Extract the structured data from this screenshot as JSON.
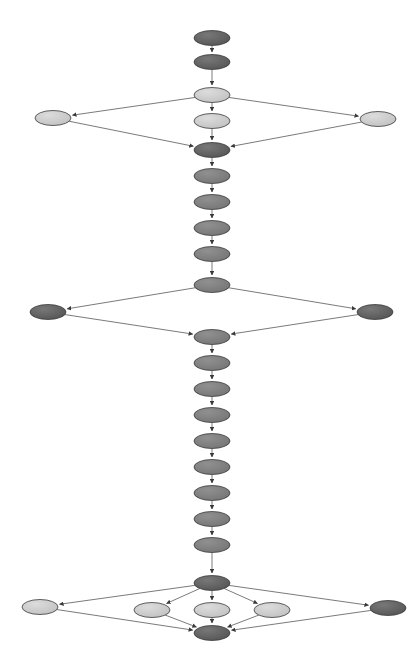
{
  "diagram": {
    "type": "node-link-graph",
    "canvas": {
      "width": 420,
      "height": 671,
      "background": "#ffffff"
    },
    "node_shape": "ellipse",
    "node_size": {
      "rx": 18,
      "ry": 7.5
    },
    "palette": {
      "dark": "#5e5e5e",
      "medium": "#7d7d7d",
      "light": "#c9c9c9",
      "node_stroke": "#3a3a3a",
      "edge": "#6b6b6b",
      "arrowhead": "#3a3a3a"
    },
    "nodes": [
      {
        "id": "n1",
        "x": 212,
        "y": 38,
        "fill": "dark",
        "label": ""
      },
      {
        "id": "n2",
        "x": 212,
        "y": 62,
        "fill": "dark",
        "label": ""
      },
      {
        "id": "n3",
        "x": 212,
        "y": 95,
        "fill": "light",
        "label": ""
      },
      {
        "id": "n4",
        "x": 212,
        "y": 121,
        "fill": "light",
        "label": ""
      },
      {
        "id": "n5",
        "x": 53,
        "y": 118,
        "fill": "light",
        "label": ""
      },
      {
        "id": "n6",
        "x": 378,
        "y": 119,
        "fill": "light",
        "label": ""
      },
      {
        "id": "n7",
        "x": 212,
        "y": 150,
        "fill": "dark",
        "label": ""
      },
      {
        "id": "n8",
        "x": 212,
        "y": 176,
        "fill": "medium",
        "label": ""
      },
      {
        "id": "n9",
        "x": 212,
        "y": 202,
        "fill": "medium",
        "label": ""
      },
      {
        "id": "n10",
        "x": 212,
        "y": 228,
        "fill": "medium",
        "label": ""
      },
      {
        "id": "n11",
        "x": 212,
        "y": 254,
        "fill": "medium",
        "label": ""
      },
      {
        "id": "n12",
        "x": 212,
        "y": 285,
        "fill": "medium",
        "label": ""
      },
      {
        "id": "n13",
        "x": 48,
        "y": 312,
        "fill": "dark",
        "label": ""
      },
      {
        "id": "n14",
        "x": 375,
        "y": 312,
        "fill": "dark",
        "label": ""
      },
      {
        "id": "n15",
        "x": 212,
        "y": 337,
        "fill": "medium",
        "label": ""
      },
      {
        "id": "n16",
        "x": 212,
        "y": 363,
        "fill": "medium",
        "label": ""
      },
      {
        "id": "n17",
        "x": 212,
        "y": 389,
        "fill": "medium",
        "label": ""
      },
      {
        "id": "n18",
        "x": 212,
        "y": 415,
        "fill": "medium",
        "label": ""
      },
      {
        "id": "n19",
        "x": 212,
        "y": 441,
        "fill": "medium",
        "label": ""
      },
      {
        "id": "n20",
        "x": 212,
        "y": 467,
        "fill": "medium",
        "label": ""
      },
      {
        "id": "n21",
        "x": 212,
        "y": 493,
        "fill": "medium",
        "label": ""
      },
      {
        "id": "n22",
        "x": 212,
        "y": 519,
        "fill": "medium",
        "label": ""
      },
      {
        "id": "n23",
        "x": 212,
        "y": 545,
        "fill": "medium",
        "label": ""
      },
      {
        "id": "n24",
        "x": 212,
        "y": 583,
        "fill": "dark",
        "label": ""
      },
      {
        "id": "n25",
        "x": 40,
        "y": 607,
        "fill": "light",
        "label": ""
      },
      {
        "id": "n26",
        "x": 152,
        "y": 610,
        "fill": "light",
        "label": ""
      },
      {
        "id": "n27",
        "x": 212,
        "y": 610,
        "fill": "light",
        "label": ""
      },
      {
        "id": "n28",
        "x": 272,
        "y": 610,
        "fill": "light",
        "label": ""
      },
      {
        "id": "n29",
        "x": 388,
        "y": 608,
        "fill": "dark",
        "label": ""
      },
      {
        "id": "n30",
        "x": 212,
        "y": 633,
        "fill": "dark",
        "label": ""
      }
    ],
    "edges": [
      {
        "from": "n1",
        "to": "n2"
      },
      {
        "from": "n2",
        "to": "n3"
      },
      {
        "from": "n3",
        "to": "n4"
      },
      {
        "from": "n3",
        "to": "n5"
      },
      {
        "from": "n3",
        "to": "n6"
      },
      {
        "from": "n4",
        "to": "n7"
      },
      {
        "from": "n5",
        "to": "n7"
      },
      {
        "from": "n6",
        "to": "n7"
      },
      {
        "from": "n7",
        "to": "n8"
      },
      {
        "from": "n8",
        "to": "n9"
      },
      {
        "from": "n9",
        "to": "n10"
      },
      {
        "from": "n10",
        "to": "n11"
      },
      {
        "from": "n11",
        "to": "n12"
      },
      {
        "from": "n12",
        "to": "n13"
      },
      {
        "from": "n12",
        "to": "n14"
      },
      {
        "from": "n13",
        "to": "n15"
      },
      {
        "from": "n14",
        "to": "n15"
      },
      {
        "from": "n15",
        "to": "n16"
      },
      {
        "from": "n16",
        "to": "n17"
      },
      {
        "from": "n17",
        "to": "n18"
      },
      {
        "from": "n18",
        "to": "n19"
      },
      {
        "from": "n19",
        "to": "n20"
      },
      {
        "from": "n20",
        "to": "n21"
      },
      {
        "from": "n21",
        "to": "n22"
      },
      {
        "from": "n22",
        "to": "n23"
      },
      {
        "from": "n23",
        "to": "n24"
      },
      {
        "from": "n24",
        "to": "n25"
      },
      {
        "from": "n24",
        "to": "n26"
      },
      {
        "from": "n24",
        "to": "n27"
      },
      {
        "from": "n24",
        "to": "n28"
      },
      {
        "from": "n24",
        "to": "n29"
      },
      {
        "from": "n25",
        "to": "n30"
      },
      {
        "from": "n26",
        "to": "n30"
      },
      {
        "from": "n27",
        "to": "n30"
      },
      {
        "from": "n28",
        "to": "n30"
      },
      {
        "from": "n29",
        "to": "n30"
      }
    ]
  }
}
